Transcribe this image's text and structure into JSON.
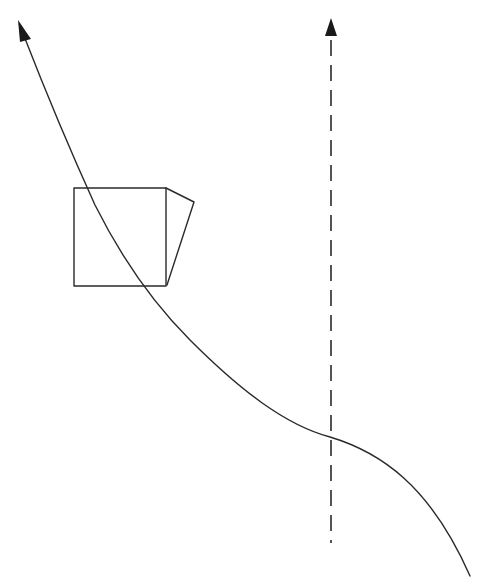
{
  "diagram": {
    "type": "line-sketch",
    "stroke_color": "#2a2a2a",
    "background": "#ffffff",
    "elements": [
      {
        "name": "curved-trajectory-arrow",
        "style": "solid",
        "direction": "up-left",
        "arrowhead": "top-left"
      },
      {
        "name": "box-shape",
        "shape": "square with slanted side face (prism-like)"
      },
      {
        "name": "vertical-dashed-axis-arrow",
        "style": "dashed",
        "direction": "up",
        "arrowhead": "top"
      }
    ],
    "labels": []
  }
}
